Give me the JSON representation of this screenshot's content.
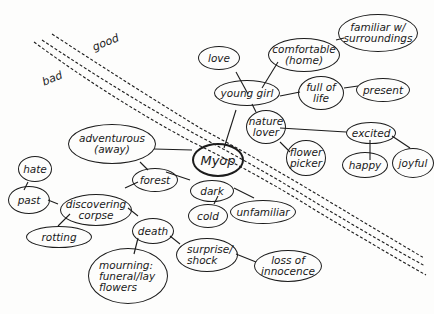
{
  "diagram": {
    "type": "mind-map",
    "center": {
      "label": "Myop"
    },
    "divider_labels": {
      "upper": "good",
      "lower": "bad"
    },
    "nodes": {
      "love": "love",
      "comfortable": "comfortable\n(home)",
      "familiar": "familiar w/\nsurroundings",
      "young_girl": "young girl",
      "full_of_life": "full of\nlife",
      "present": "present",
      "nature_lover": "nature\nlover",
      "excited": "excited",
      "flower_picker": "flower\npicker",
      "happy": "happy",
      "joyful": "joyful",
      "adventurous": "adventurous\n(away)",
      "hate": "hate",
      "past": "past",
      "forest": "forest",
      "discovering_corpse": "discovering\ncorpse",
      "dark": "dark",
      "cold": "cold",
      "unfamiliar": "unfamiliar",
      "rotting": "rotting",
      "death": "death",
      "mourning": "mourning:\nfuneral/lay\nflowers",
      "surprise": "surprise/\nshock",
      "loss": "loss of\ninnocence"
    },
    "edges": [
      [
        "Myop",
        "young girl"
      ],
      [
        "young girl",
        "love"
      ],
      [
        "young girl",
        "comfortable (home)"
      ],
      [
        "comfortable (home)",
        "familiar w/ surroundings"
      ],
      [
        "young girl",
        "full of life"
      ],
      [
        "full of life",
        "present"
      ],
      [
        "young girl",
        "nature lover"
      ],
      [
        "nature lover",
        "excited"
      ],
      [
        "nature lover",
        "flower picker"
      ],
      [
        "excited",
        "happy"
      ],
      [
        "excited",
        "joyful"
      ],
      [
        "Myop",
        "adventurous (away)"
      ],
      [
        "adventurous (away)",
        "forest"
      ],
      [
        "forest",
        "dark"
      ],
      [
        "dark",
        "cold"
      ],
      [
        "dark",
        "unfamiliar"
      ],
      [
        "forest",
        "discovering corpse"
      ],
      [
        "discovering corpse",
        "past"
      ],
      [
        "past",
        "hate"
      ],
      [
        "discovering corpse",
        "rotting"
      ],
      [
        "discovering corpse",
        "death"
      ],
      [
        "death",
        "mourning: funeral/lay flowers"
      ],
      [
        "death",
        "surprise/shock"
      ],
      [
        "surprise/shock",
        "loss of innocence"
      ]
    ],
    "colors": {
      "ink": "#1c1c1c",
      "paper": "#fdfdfc"
    }
  }
}
